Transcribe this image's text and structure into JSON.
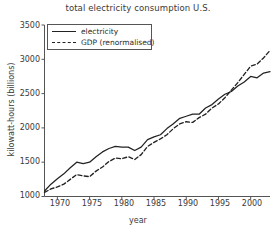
{
  "chart_data": {
    "type": "line",
    "title": "total electricity consumption U.S.",
    "xlabel": "year",
    "ylabel": "kilowatt-hours (billions)",
    "xlim": [
      1968,
      2003
    ],
    "ylim": [
      1000,
      3500
    ],
    "xticks": [
      1970,
      1975,
      1980,
      1985,
      1990,
      1995,
      2000
    ],
    "yticks": [
      1000,
      1500,
      2000,
      2500,
      3000,
      3500
    ],
    "grid": false,
    "legend_position": "upper left",
    "x": [
      1968,
      1969,
      1970,
      1971,
      1972,
      1973,
      1974,
      1975,
      1976,
      1977,
      1978,
      1979,
      1980,
      1981,
      1982,
      1983,
      1984,
      1985,
      1986,
      1987,
      1988,
      1989,
      1990,
      1991,
      1992,
      1993,
      1994,
      1995,
      1996,
      1997,
      1998,
      1999,
      2000,
      2001,
      2002,
      2003
    ],
    "series": [
      {
        "name": "electricity",
        "style": "solid",
        "color": "#222222",
        "values": [
          1080,
          1180,
          1260,
          1330,
          1420,
          1500,
          1480,
          1500,
          1580,
          1650,
          1700,
          1730,
          1720,
          1720,
          1670,
          1720,
          1830,
          1870,
          1900,
          1990,
          2060,
          2140,
          2170,
          2200,
          2200,
          2290,
          2340,
          2420,
          2490,
          2530,
          2610,
          2670,
          2750,
          2730,
          2800,
          2820
        ]
      },
      {
        "name": "GDP (renormalised)",
        "style": "dashed",
        "color": "#222222",
        "values": [
          1060,
          1110,
          1140,
          1180,
          1250,
          1320,
          1300,
          1290,
          1370,
          1430,
          1510,
          1560,
          1550,
          1580,
          1540,
          1610,
          1730,
          1790,
          1840,
          1900,
          1990,
          2060,
          2090,
          2080,
          2150,
          2200,
          2290,
          2350,
          2440,
          2550,
          2660,
          2780,
          2900,
          2930,
          3020,
          3130
        ]
      }
    ]
  },
  "legend": {
    "items": [
      {
        "label": "electricity",
        "swatch": "solid-line-swatch"
      },
      {
        "label": "GDP (renormalised)",
        "swatch": "dashed-line-swatch"
      }
    ]
  },
  "axis": {
    "y_tick_labels": [
      "1000",
      "1500",
      "2000",
      "2500",
      "3000",
      "3500"
    ],
    "x_tick_labels": [
      "1970",
      "1975",
      "1980",
      "1985",
      "1990",
      "1995",
      "2000"
    ]
  }
}
